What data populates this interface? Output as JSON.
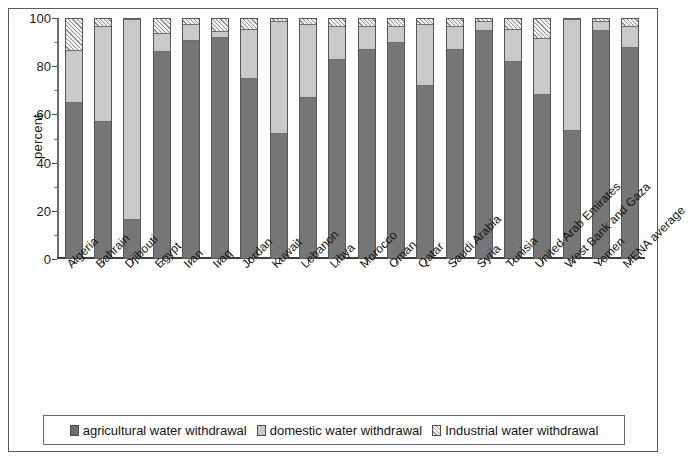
{
  "chart_data": {
    "type": "bar",
    "subtype": "stacked-100-percent",
    "title": "",
    "xlabel": "",
    "ylabel": "percent",
    "ylim": [
      0,
      100
    ],
    "yticks": [
      0,
      20,
      40,
      60,
      80,
      100
    ],
    "grid": false,
    "legend_position": "bottom",
    "categories": [
      "Algeria",
      "Bahrain",
      "Djibouti",
      "Egypt",
      "Iran",
      "Iraq",
      "Jordan",
      "Kuwait",
      "Lebanon",
      "Libya",
      "Morocco",
      "Oman",
      "Qatar",
      "Saudi Arabia",
      "Syria",
      "Tunisia",
      "United Arab Emirates",
      "West Bank and Gaza",
      "Yemen",
      "MENA average"
    ],
    "series": [
      {
        "name": "agricultural water withdrawal",
        "color": "#767676",
        "values": [
          65,
          57,
          16,
          86,
          91,
          92,
          75,
          52,
          67,
          83,
          87,
          90,
          72,
          87,
          95,
          82,
          68,
          53,
          95,
          88
        ]
      },
      {
        "name": "domestic water withdrawal",
        "color": "#c9c9c9",
        "values": [
          22,
          40,
          84,
          8,
          7,
          3,
          21,
          47,
          31,
          14,
          10,
          7,
          26,
          10,
          4,
          14,
          24,
          47,
          4,
          9
        ]
      },
      {
        "name": "Industrial water withdrawal",
        "color": "#f2f2f2",
        "pattern": "diagonal-hatch",
        "values": [
          13,
          3,
          0,
          6,
          2,
          5,
          4,
          1,
          2,
          3,
          3,
          3,
          2,
          3,
          1,
          4,
          8,
          0,
          1,
          3
        ]
      }
    ]
  },
  "legend": {
    "items": [
      {
        "label": "agricultural water withdrawal",
        "swatch": "swatch-agr"
      },
      {
        "label": "domestic water withdrawal",
        "swatch": "swatch-dom"
      },
      {
        "label": "Industrial water withdrawal",
        "swatch": "swatch-ind"
      }
    ]
  },
  "colors": {
    "agricultural": "#767676",
    "domestic": "#c9c9c9",
    "industrial": "#f2f2f2",
    "frame": "#5a5a5a",
    "text": "#141414"
  }
}
